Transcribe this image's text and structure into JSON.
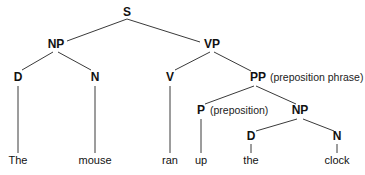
{
  "diagram": {
    "type": "syntax-tree",
    "sentence": "The mouse ran up the clock",
    "nodes": {
      "S": {
        "label": "S",
        "x": 127,
        "y": 16
      },
      "NP1": {
        "label": "NP",
        "x": 56,
        "y": 48
      },
      "VP": {
        "label": "VP",
        "x": 212,
        "y": 48
      },
      "D1": {
        "label": "D",
        "x": 18,
        "y": 81
      },
      "N1": {
        "label": "N",
        "x": 95,
        "y": 81
      },
      "V": {
        "label": "V",
        "x": 170,
        "y": 81
      },
      "PP": {
        "label": "PP",
        "x": 258,
        "y": 81,
        "gloss": "(preposition phrase)"
      },
      "P": {
        "label": "P",
        "x": 201,
        "y": 114,
        "gloss": "(preposition)"
      },
      "NP2": {
        "label": "NP",
        "x": 300,
        "y": 114
      },
      "D2": {
        "label": "D",
        "x": 251,
        "y": 140
      },
      "N2": {
        "label": "N",
        "x": 337,
        "y": 140
      }
    },
    "leaves": [
      {
        "word": "The",
        "x": 18,
        "y": 164
      },
      {
        "word": "mouse",
        "x": 95,
        "y": 164
      },
      {
        "word": "ran",
        "x": 170,
        "y": 164
      },
      {
        "word": "up",
        "x": 201,
        "y": 164
      },
      {
        "word": "the",
        "x": 251,
        "y": 164
      },
      {
        "word": "clock",
        "x": 337,
        "y": 164
      }
    ]
  }
}
